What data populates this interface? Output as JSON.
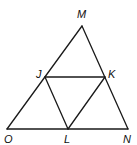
{
  "figure": {
    "type": "triangle-midsegment-diagram",
    "points": {
      "M": {
        "label": "M",
        "x": 82,
        "y": 26,
        "lx": 81,
        "ly": 18
      },
      "O": {
        "label": "O",
        "x": 7,
        "y": 129,
        "lx": 8,
        "ly": 143
      },
      "N": {
        "label": "N",
        "x": 128,
        "y": 129,
        "lx": 127,
        "ly": 143
      },
      "J": {
        "label": "J",
        "x": 45,
        "y": 77,
        "lx": 37,
        "ly": 78
      },
      "K": {
        "label": "K",
        "x": 105,
        "y": 77,
        "lx": 111,
        "ly": 78
      },
      "L": {
        "label": "L",
        "x": 68,
        "y": 129,
        "lx": 67,
        "ly": 143
      }
    },
    "segments": [
      [
        "M",
        "O"
      ],
      [
        "M",
        "N"
      ],
      [
        "O",
        "N"
      ],
      [
        "J",
        "K"
      ],
      [
        "J",
        "L"
      ],
      [
        "K",
        "L"
      ]
    ],
    "colors": {
      "stroke": "#1a1a1a",
      "label": "#111111",
      "background": "#ffffff"
    }
  }
}
